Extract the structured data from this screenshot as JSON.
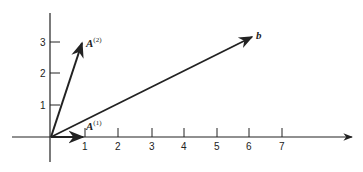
{
  "diagram": {
    "type": "vector-plot",
    "axes": {
      "x_ticks": [
        "1",
        "2",
        "3",
        "4",
        "5",
        "6",
        "7"
      ],
      "y_ticks": [
        "1",
        "2",
        "3"
      ]
    },
    "vectors": [
      {
        "name": "A1",
        "label": "A",
        "superscript": "(1)",
        "from": [
          0,
          0
        ],
        "to": [
          1,
          0
        ]
      },
      {
        "name": "A2",
        "label": "A",
        "superscript": "(2)",
        "from": [
          0,
          0
        ],
        "to": [
          1,
          3
        ]
      },
      {
        "name": "b",
        "label": "b",
        "superscript": "",
        "from": [
          0,
          0
        ],
        "to": [
          6,
          3
        ]
      }
    ],
    "colors": {
      "stroke": "#222222",
      "background": "#ffffff"
    }
  }
}
